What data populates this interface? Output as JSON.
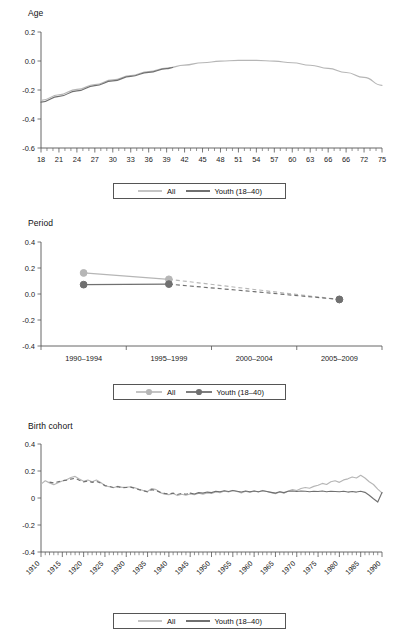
{
  "figure": {
    "series_names": {
      "all": "All",
      "youth": "Youth (18–40)"
    },
    "colors": {
      "all": "#b6b6b6",
      "youth": "#707070",
      "axis": "#555555",
      "text": "#1a1a1a"
    }
  },
  "legend": {
    "all_label": "All",
    "youth_label": "Youth (18–40)"
  },
  "panels": {
    "age": {
      "title": "Age"
    },
    "period": {
      "title": "Period"
    },
    "cohort": {
      "title": "Birth cohort"
    }
  },
  "chart_data": [
    {
      "type": "line",
      "title": "Age",
      "xlabel": "",
      "ylabel": "",
      "grid": false,
      "legend_position": "bottom",
      "xlim": [
        18,
        75
      ],
      "ylim": [
        -0.6,
        0.2
      ],
      "yticks": [
        "0.2",
        "0.0",
        "-0.2",
        "-0.4",
        "-0.6"
      ],
      "ytick_values": [
        0.2,
        0.0,
        -0.2,
        -0.4,
        -0.6
      ],
      "xticks": [
        "18",
        "21",
        "24",
        "27",
        "30",
        "33",
        "36",
        "39",
        "42",
        "45",
        "48",
        "51",
        "54",
        "57",
        "60",
        "63",
        "66",
        "66",
        "72",
        "75"
      ],
      "xtick_values": [
        18,
        21,
        24,
        27,
        30,
        33,
        36,
        39,
        42,
        45,
        48,
        51,
        54,
        57,
        60,
        63,
        66,
        69,
        72,
        75
      ],
      "xtick_minor_step": 1,
      "series": [
        {
          "name": "All",
          "style": "solid",
          "x": [
            18,
            21,
            24,
            27,
            30,
            33,
            36,
            39,
            42,
            45,
            48,
            51,
            54,
            57,
            60,
            63,
            66,
            69,
            72,
            75
          ],
          "values": [
            -0.272,
            -0.233,
            -0.196,
            -0.162,
            -0.13,
            -0.1,
            -0.073,
            -0.049,
            -0.028,
            -0.012,
            -0.001,
            0.004,
            0.004,
            -0.001,
            -0.012,
            -0.029,
            -0.051,
            -0.079,
            -0.113,
            -0.168
          ]
        },
        {
          "name": "Youth (18–40)",
          "style": "solid",
          "x": [
            18,
            21,
            24,
            27,
            30,
            33,
            36,
            39,
            40
          ],
          "values": [
            -0.284,
            -0.244,
            -0.206,
            -0.17,
            -0.137,
            -0.106,
            -0.078,
            -0.053,
            -0.045
          ]
        }
      ]
    },
    {
      "type": "line",
      "title": "Period",
      "xlabel": "",
      "ylabel": "",
      "grid": false,
      "legend_position": "bottom",
      "ylim": [
        -0.4,
        0.4
      ],
      "yticks": [
        "0.4",
        "0.2",
        "0.0",
        "-0.2",
        "-0.4"
      ],
      "ytick_values": [
        0.4,
        0.2,
        0.0,
        -0.2,
        -0.4
      ],
      "categories": [
        "1990–1994",
        "1995–1999",
        "2000–2004",
        "2005–2009"
      ],
      "series": [
        {
          "name": "All",
          "style": "solid-then-dashed",
          "markers": [
            true,
            true,
            false,
            true
          ],
          "solid_through_index": 1,
          "values": [
            0.162,
            0.113,
            0.035,
            -0.042
          ]
        },
        {
          "name": "Youth (18–40)",
          "style": "solid-then-dashed",
          "markers": [
            true,
            true,
            false,
            true
          ],
          "solid_through_index": 1,
          "values": [
            0.072,
            0.076,
            0.018,
            -0.042
          ]
        }
      ]
    },
    {
      "type": "line",
      "title": "Birth cohort",
      "xlabel": "",
      "ylabel": "",
      "grid": false,
      "legend_position": "bottom",
      "xlim": [
        1910,
        1990
      ],
      "ylim": [
        -0.4,
        0.4
      ],
      "yticks": [
        "0.4",
        "0.2",
        "0",
        "-0.2",
        "-0.4"
      ],
      "ytick_values": [
        0.4,
        0.2,
        0.0,
        -0.2,
        -0.4
      ],
      "xticks": [
        "1910",
        "1915",
        "1920",
        "1925",
        "1930",
        "1935",
        "1940",
        "1945",
        "1950",
        "1955",
        "1960",
        "1965",
        "1970",
        "1975",
        "1980",
        "1985",
        "1990"
      ],
      "xtick_values": [
        1910,
        1915,
        1920,
        1925,
        1930,
        1935,
        1940,
        1945,
        1950,
        1955,
        1960,
        1965,
        1970,
        1975,
        1980,
        1985,
        1990
      ],
      "xtick_rotation": 45,
      "xtick_minor_step": 1,
      "series": [
        {
          "name": "All",
          "style": "solid",
          "x": [
            1910,
            1911,
            1912,
            1913,
            1914,
            1915,
            1916,
            1917,
            1918,
            1919,
            1920,
            1921,
            1922,
            1923,
            1924,
            1925,
            1926,
            1927,
            1928,
            1929,
            1930,
            1931,
            1932,
            1933,
            1934,
            1935,
            1936,
            1937,
            1938,
            1939,
            1940,
            1941,
            1942,
            1943,
            1944,
            1945,
            1946,
            1947,
            1948,
            1949,
            1950,
            1951,
            1952,
            1953,
            1954,
            1955,
            1956,
            1957,
            1958,
            1959,
            1960,
            1961,
            1962,
            1963,
            1964,
            1965,
            1966,
            1967,
            1968,
            1969,
            1970,
            1971,
            1972,
            1973,
            1974,
            1975,
            1976,
            1977,
            1978,
            1979,
            1980,
            1981,
            1982,
            1983,
            1984,
            1985,
            1986,
            1987,
            1988,
            1989,
            1990
          ],
          "values": [
            0.103,
            0.128,
            0.112,
            0.098,
            0.113,
            0.126,
            0.135,
            0.152,
            0.16,
            0.14,
            0.124,
            0.133,
            0.12,
            0.133,
            0.115,
            0.092,
            0.083,
            0.076,
            0.087,
            0.079,
            0.08,
            0.083,
            0.076,
            0.064,
            0.056,
            0.048,
            0.07,
            0.062,
            0.04,
            0.029,
            0.025,
            0.033,
            0.018,
            0.028,
            0.02,
            0.03,
            0.024,
            0.035,
            0.028,
            0.038,
            0.033,
            0.045,
            0.04,
            0.052,
            0.044,
            0.056,
            0.048,
            0.038,
            0.05,
            0.042,
            0.052,
            0.044,
            0.056,
            0.048,
            0.04,
            0.032,
            0.045,
            0.036,
            0.052,
            0.062,
            0.056,
            0.07,
            0.078,
            0.072,
            0.086,
            0.094,
            0.108,
            0.1,
            0.12,
            0.128,
            0.116,
            0.134,
            0.142,
            0.156,
            0.148,
            0.168,
            0.148,
            0.12,
            0.1,
            0.066,
            0.038
          ]
        },
        {
          "name": "Youth (18–40)",
          "style": "solid-with-dashed-lead",
          "x": [
            1912,
            1913,
            1914,
            1915,
            1916,
            1917,
            1918,
            1919,
            1920,
            1921,
            1922,
            1923,
            1924,
            1925,
            1926,
            1927,
            1928,
            1929,
            1930,
            1931,
            1932,
            1933,
            1934,
            1935,
            1936,
            1937,
            1938,
            1939,
            1940,
            1941,
            1942,
            1943,
            1944,
            1945,
            1946,
            1947,
            1948,
            1949,
            1950,
            1951,
            1952,
            1953,
            1954,
            1955,
            1956,
            1957,
            1958,
            1959,
            1960,
            1961,
            1962,
            1963,
            1964,
            1965,
            1966,
            1967,
            1968,
            1969,
            1970,
            1971,
            1972,
            1973,
            1974,
            1975,
            1976,
            1977,
            1978,
            1979,
            1980,
            1981,
            1982,
            1983,
            1984,
            1985,
            1986,
            1987,
            1988,
            1989,
            1990
          ],
          "values": [
            0.118,
            0.112,
            0.12,
            0.128,
            0.132,
            0.14,
            0.146,
            0.132,
            0.12,
            0.126,
            0.116,
            0.124,
            0.11,
            0.092,
            0.086,
            0.078,
            0.084,
            0.076,
            0.078,
            0.08,
            0.072,
            0.062,
            0.054,
            0.046,
            0.062,
            0.056,
            0.042,
            0.034,
            0.03,
            0.036,
            0.026,
            0.034,
            0.028,
            0.036,
            0.03,
            0.04,
            0.036,
            0.044,
            0.04,
            0.05,
            0.046,
            0.054,
            0.048,
            0.056,
            0.05,
            0.044,
            0.052,
            0.046,
            0.052,
            0.046,
            0.054,
            0.048,
            0.042,
            0.036,
            0.046,
            0.04,
            0.05,
            0.052,
            0.048,
            0.052,
            0.05,
            0.046,
            0.05,
            0.048,
            0.052,
            0.046,
            0.05,
            0.048,
            0.046,
            0.05,
            0.044,
            0.048,
            0.044,
            0.05,
            0.042,
            0.02,
            -0.006,
            -0.03,
            0.04
          ]
        }
      ]
    }
  ]
}
